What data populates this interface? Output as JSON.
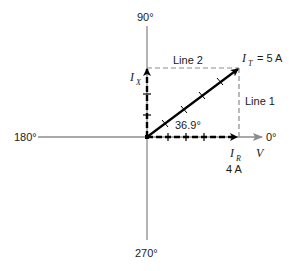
{
  "diagram": {
    "axes": {
      "angle_top": "90°",
      "angle_left": "180°",
      "angle_right": "0°",
      "angle_bottom": "270°",
      "reference_label": "V"
    },
    "phasors": {
      "total": {
        "symbol": "I",
        "subscript": "T",
        "value_text": "= 5 A",
        "magnitude": 5,
        "unit": "A"
      },
      "resistive": {
        "symbol": "I",
        "subscript": "R",
        "value_text": "4 A",
        "magnitude": 4,
        "unit": "A"
      },
      "reactive": {
        "symbol": "I",
        "subscript": "X"
      }
    },
    "angle_label": "36.9°",
    "construction_lines": {
      "line1": "Line 1",
      "line2": "Line 2"
    },
    "colors": {
      "axis": "#8c8c8c",
      "phasor": "#000000",
      "dashed_guide": "#8c8c8c",
      "text": "#1a1a1a"
    }
  }
}
